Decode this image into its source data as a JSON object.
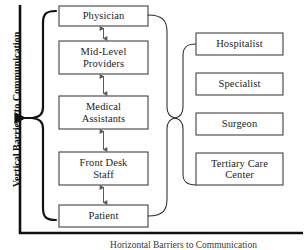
{
  "diagram": {
    "axis_label": "Vertical Barriers to Communication",
    "bottom_caption": "Horizontal Barriers to Communication",
    "colors": {
      "axis": "#111111",
      "box_border": "#4a4a4a",
      "connector": "#2b2b2b",
      "brace": "#111111",
      "text": "#1d1d1d",
      "background": "#ffffff"
    },
    "left_column": {
      "name": "vertical-hierarchy",
      "boxes": [
        {
          "label": "Physician",
          "lines": [
            "Physician"
          ]
        },
        {
          "label": "Mid-Level Providers",
          "lines": [
            "Mid-Level",
            "Providers"
          ]
        },
        {
          "label": "Medical Assistants",
          "lines": [
            "Medical",
            "Assistants"
          ]
        },
        {
          "label": "Front Desk Staff",
          "lines": [
            "Front Desk",
            "Staff"
          ]
        },
        {
          "label": "Patient",
          "lines": [
            "Patient"
          ]
        }
      ],
      "connector_type": "double-headed-arrow",
      "arrow_count": 4
    },
    "right_column": {
      "name": "external-providers",
      "boxes": [
        {
          "label": "Hospitalist",
          "lines": [
            "Hospitalist"
          ]
        },
        {
          "label": "Specialist",
          "lines": [
            "Specialist"
          ]
        },
        {
          "label": "Surgeon",
          "lines": [
            "Surgeon"
          ]
        },
        {
          "label": "Tertiary Care Center",
          "lines": [
            "Tertiary Care",
            "Center"
          ]
        }
      ]
    },
    "brace": {
      "name": "vertical-barriers-brace",
      "spans": "Physician through Patient"
    }
  }
}
